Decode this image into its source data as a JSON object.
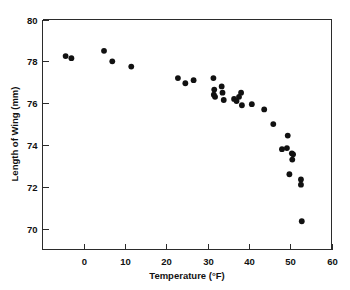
{
  "chart_data": {
    "type": "scatter",
    "title": "",
    "xlabel": "Temperature (°F)",
    "ylabel": "Length of Wing (mm)",
    "xlim": [
      -10,
      60
    ],
    "ylim": [
      69,
      80
    ],
    "grid": false,
    "legend": null,
    "xticks": [
      0,
      10,
      20,
      30,
      40,
      50,
      60
    ],
    "xtick_labels": [
      "0",
      "10",
      "20",
      "30",
      "40",
      "50",
      "60"
    ],
    "yticks": [
      70,
      72,
      74,
      76,
      78,
      80
    ],
    "ytick_labels": [
      "70",
      "72",
      "74",
      "76",
      "78",
      "80"
    ],
    "marker": "filled-circle",
    "marker_color": "#111111",
    "points": [
      {
        "x": -4.4,
        "y": 78.25
      },
      {
        "x": -3.0,
        "y": 78.15
      },
      {
        "x": 4.9,
        "y": 78.5
      },
      {
        "x": 6.9,
        "y": 78.0
      },
      {
        "x": 11.5,
        "y": 77.75
      },
      {
        "x": 22.8,
        "y": 77.2
      },
      {
        "x": 24.6,
        "y": 76.95
      },
      {
        "x": 26.6,
        "y": 77.1
      },
      {
        "x": 31.4,
        "y": 77.2
      },
      {
        "x": 31.6,
        "y": 76.65
      },
      {
        "x": 31.5,
        "y": 76.4
      },
      {
        "x": 31.8,
        "y": 76.3
      },
      {
        "x": 33.4,
        "y": 76.8
      },
      {
        "x": 33.6,
        "y": 76.5
      },
      {
        "x": 33.9,
        "y": 76.15
      },
      {
        "x": 36.4,
        "y": 76.2
      },
      {
        "x": 37.0,
        "y": 76.1
      },
      {
        "x": 37.6,
        "y": 76.3
      },
      {
        "x": 38.1,
        "y": 76.5
      },
      {
        "x": 38.3,
        "y": 75.9
      },
      {
        "x": 40.7,
        "y": 75.95
      },
      {
        "x": 43.7,
        "y": 75.7
      },
      {
        "x": 45.9,
        "y": 75.0
      },
      {
        "x": 48.0,
        "y": 73.8
      },
      {
        "x": 49.2,
        "y": 73.85
      },
      {
        "x": 49.4,
        "y": 74.45
      },
      {
        "x": 50.4,
        "y": 73.6
      },
      {
        "x": 50.7,
        "y": 73.55
      },
      {
        "x": 50.5,
        "y": 73.3
      },
      {
        "x": 49.8,
        "y": 72.6
      },
      {
        "x": 52.6,
        "y": 72.35
      },
      {
        "x": 52.6,
        "y": 72.1
      },
      {
        "x": 52.8,
        "y": 70.35
      }
    ]
  }
}
